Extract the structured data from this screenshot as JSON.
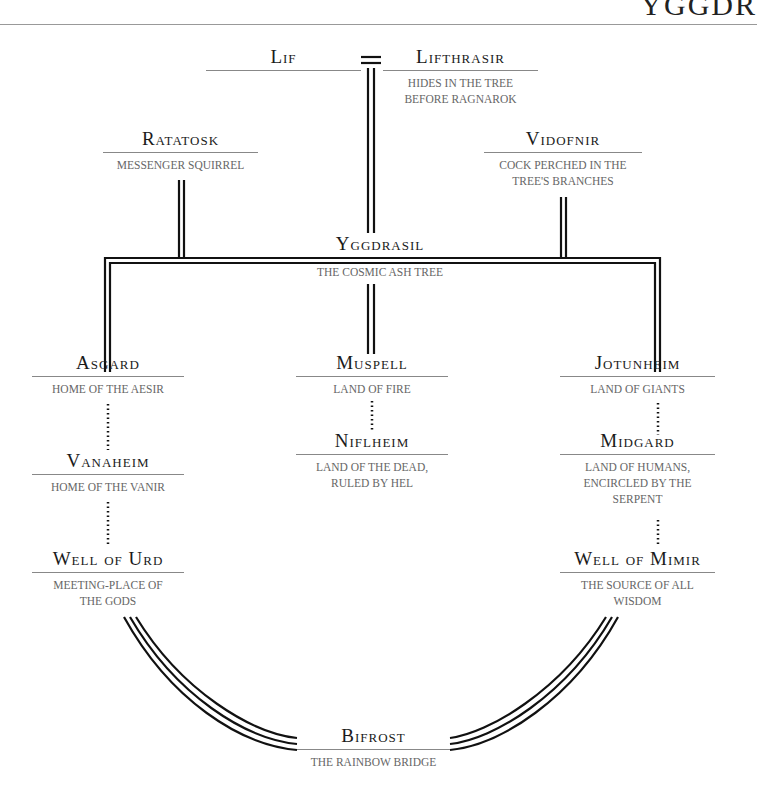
{
  "header": {
    "title": "YGGDR"
  },
  "nodes": {
    "lif": {
      "name": "Lif",
      "desc": ""
    },
    "lifthrasir": {
      "name": "Lifthrasir",
      "desc": "Hides in the tree\nbefore Ragnarok"
    },
    "ratatosk": {
      "name": "Ratatosk",
      "desc": "Messenger squirrel"
    },
    "vidofnir": {
      "name": "Vidofnir",
      "desc": "Cock perched in the\ntree's branches"
    },
    "yggdrasil": {
      "name": "Yggdrasil",
      "desc": "The cosmic ash tree"
    },
    "asgard": {
      "name": "Asgard",
      "desc": "Home of the Aesir"
    },
    "vanaheim": {
      "name": "Vanaheim",
      "desc": "Home of the Vanir"
    },
    "well_of_urd": {
      "name": "Well of Urd",
      "desc": "Meeting-place of\nthe gods"
    },
    "muspell": {
      "name": "Muspell",
      "desc": "Land of fire"
    },
    "niflheim": {
      "name": "Niflheim",
      "desc": "Land of the dead,\nruled by Hel"
    },
    "jotunheim": {
      "name": "Jotunheim",
      "desc": "Land of giants"
    },
    "midgard": {
      "name": "Midgard",
      "desc": "Land of humans,\nencircled by the\nserpent"
    },
    "well_of_mimir": {
      "name": "Well of Mimir",
      "desc": "The source of all\nwisdom"
    },
    "bifrost": {
      "name": "Bifrost",
      "desc": "The rainbow bridge"
    }
  },
  "connector": {
    "marriage_symbol": "="
  },
  "colors": {
    "line": "#111111",
    "rule": "#888888",
    "desc_text": "#666666",
    "name_text": "#1a1a1a"
  }
}
